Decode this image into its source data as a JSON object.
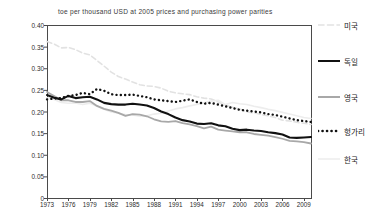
{
  "chart_data": {
    "type": "line",
    "title": "toe per thousand USD at 2005 prices and purchasing power parities",
    "xlabel": "",
    "ylabel": "",
    "ylim": [
      0,
      0.4
    ],
    "xlim": [
      1973,
      2010
    ],
    "grid": false,
    "legend_position": "right",
    "ytick_labels": [
      "0.40",
      "0.35",
      "0.30",
      "0.25",
      "0.20",
      "0.15",
      "0.10",
      "0.05",
      "0"
    ],
    "ytick_values": [
      0.4,
      0.35,
      0.3,
      0.25,
      0.2,
      0.15,
      0.1,
      0.05,
      0
    ],
    "xtick_labels": [
      "1973",
      "1976",
      "1979",
      "1982",
      "1985",
      "1988",
      "1991",
      "1994",
      "1997",
      "2000",
      "2003",
      "2006",
      "2009"
    ],
    "xtick_values": [
      1973,
      1976,
      1979,
      1982,
      1985,
      1988,
      1991,
      1994,
      1997,
      2000,
      2003,
      2006,
      2009
    ],
    "x": [
      1973,
      1974,
      1975,
      1976,
      1977,
      1978,
      1979,
      1980,
      1981,
      1982,
      1983,
      1984,
      1985,
      1986,
      1987,
      1988,
      1989,
      1990,
      1991,
      1992,
      1993,
      1994,
      1995,
      1996,
      1997,
      1998,
      1999,
      2000,
      2001,
      2002,
      2003,
      2004,
      2005,
      2006,
      2007,
      2008,
      2009,
      2010
    ],
    "series": [
      {
        "name": "미국",
        "color": "#e2e2e2",
        "style": "dashed",
        "width": 1.6,
        "values": [
          0.362,
          0.356,
          0.347,
          0.348,
          0.343,
          0.335,
          0.331,
          0.318,
          0.305,
          0.291,
          0.281,
          0.275,
          0.268,
          0.262,
          0.259,
          0.258,
          0.254,
          0.247,
          0.243,
          0.241,
          0.239,
          0.234,
          0.231,
          0.229,
          0.222,
          0.215,
          0.21,
          0.206,
          0.199,
          0.197,
          0.193,
          0.19,
          0.186,
          0.18,
          0.178,
          0.175,
          0.173,
          0.17
        ]
      },
      {
        "name": "독일",
        "color": "#111111",
        "style": "solid",
        "width": 2.1,
        "values": [
          0.238,
          0.232,
          0.228,
          0.236,
          0.231,
          0.233,
          0.234,
          0.228,
          0.22,
          0.217,
          0.216,
          0.216,
          0.218,
          0.216,
          0.214,
          0.208,
          0.2,
          0.194,
          0.186,
          0.18,
          0.177,
          0.172,
          0.171,
          0.173,
          0.168,
          0.166,
          0.16,
          0.157,
          0.158,
          0.156,
          0.155,
          0.152,
          0.15,
          0.147,
          0.14,
          0.139,
          0.14,
          0.141
        ]
      },
      {
        "name": "영국",
        "color": "#a8a8a8",
        "style": "solid",
        "width": 1.8,
        "values": [
          0.245,
          0.236,
          0.226,
          0.226,
          0.222,
          0.222,
          0.224,
          0.213,
          0.206,
          0.202,
          0.197,
          0.19,
          0.194,
          0.193,
          0.189,
          0.182,
          0.177,
          0.176,
          0.178,
          0.173,
          0.17,
          0.166,
          0.161,
          0.165,
          0.158,
          0.156,
          0.154,
          0.152,
          0.152,
          0.148,
          0.146,
          0.144,
          0.141,
          0.137,
          0.132,
          0.131,
          0.129,
          0.126
        ]
      },
      {
        "name": "헝가리",
        "color": "#111111",
        "style": "dotted",
        "width": 2.2,
        "values": [
          0.228,
          0.23,
          0.231,
          0.236,
          0.238,
          0.243,
          0.24,
          0.252,
          0.248,
          0.24,
          0.238,
          0.238,
          0.239,
          0.236,
          0.233,
          0.228,
          0.226,
          0.224,
          0.222,
          0.225,
          0.228,
          0.222,
          0.218,
          0.22,
          0.216,
          0.212,
          0.208,
          0.204,
          0.202,
          0.2,
          0.198,
          0.194,
          0.192,
          0.188,
          0.184,
          0.18,
          0.178,
          0.176
        ]
      },
      {
        "name": "한국",
        "color": "#ededed",
        "style": "solid",
        "width": 1.6,
        "values": [
          0.232,
          0.228,
          0.221,
          0.219,
          0.22,
          0.216,
          0.219,
          0.212,
          0.205,
          0.199,
          0.196,
          0.193,
          0.192,
          0.189,
          0.19,
          0.194,
          0.196,
          0.201,
          0.206,
          0.209,
          0.213,
          0.216,
          0.22,
          0.224,
          0.226,
          0.216,
          0.221,
          0.218,
          0.216,
          0.212,
          0.209,
          0.205,
          0.202,
          0.198,
          0.194,
          0.19,
          0.186,
          0.184
        ]
      }
    ],
    "legend": [
      {
        "label": "미국",
        "y": 25
      },
      {
        "label": "독일",
        "y": 61
      },
      {
        "label": "영국",
        "y": 97
      },
      {
        "label": "헝가리",
        "y": 131
      },
      {
        "label": "한국",
        "y": 159
      }
    ]
  },
  "axes": {
    "plot_left": 47,
    "plot_right": 311,
    "plot_top": 25,
    "plot_bottom": 198
  }
}
